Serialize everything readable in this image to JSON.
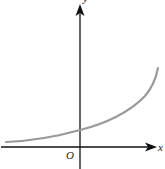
{
  "diagram": {
    "type": "function-graph",
    "axes": {
      "x_label": "x",
      "y_label": "y",
      "origin_label": "O"
    },
    "colors": {
      "axis": "#111111",
      "curve": "#9a9a9a",
      "label": "#222222"
    }
  }
}
